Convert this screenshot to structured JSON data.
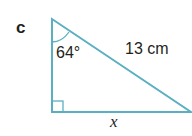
{
  "question": {
    "part_label": "c",
    "angle_label": "64°",
    "hypotenuse_label": "13 cm",
    "base_label": "x",
    "colors": {
      "triangle_stroke": "#5aafc0",
      "text": "#231f20"
    },
    "shape": "right-angled triangle with right angle at bottom-left"
  }
}
